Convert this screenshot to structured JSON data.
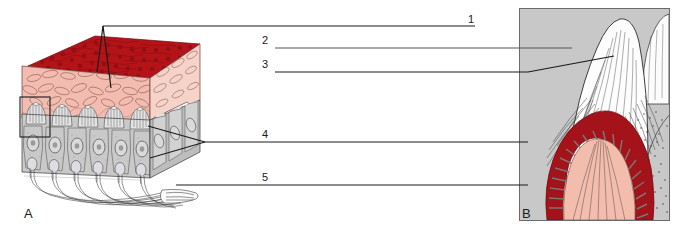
{
  "figure": {
    "panels": [
      {
        "id": "A",
        "letter": "A",
        "caption": "A",
        "description": "Three-dimensional block diagram of lingual epithelium with taste buds and nerve fibres"
      },
      {
        "id": "B",
        "letter": "B",
        "caption": "B",
        "description": "Sectional view of a filiform papilla on grey background"
      }
    ],
    "leader_labels": [
      {
        "number": "1",
        "text": "1",
        "line_color": "#1a1a1a",
        "line": {
          "x1": 103,
          "y1": 26,
          "x2": 475,
          "y2": 26
        },
        "label_pos": {
          "x": 468,
          "y": 16
        },
        "pointers": [
          {
            "x1": 103,
            "y1": 26,
            "x2": 97,
            "y2": 70
          },
          {
            "x1": 103,
            "y1": 26,
            "x2": 110,
            "y2": 86
          }
        ]
      },
      {
        "number": "2",
        "text": "2",
        "line_color": "#4a5a50",
        "line": {
          "x1": 275,
          "y1": 48,
          "x2": 570,
          "y2": 48
        },
        "label_pos": {
          "x": 262,
          "y": 36
        },
        "pointers": []
      },
      {
        "number": "3",
        "text": "3",
        "line_color": "#1a1a1a",
        "line": {
          "x1": 275,
          "y1": 72,
          "x2": 528,
          "y2": 72
        },
        "label_pos": {
          "x": 262,
          "y": 60
        },
        "pointers": [
          {
            "x1": 528,
            "y1": 72,
            "x2": 612,
            "y2": 56
          }
        ]
      },
      {
        "number": "4",
        "text": "4",
        "line_color": "#1a1a1a",
        "line": {
          "x1": 205,
          "y1": 142,
          "x2": 528,
          "y2": 142
        },
        "label_pos": {
          "x": 262,
          "y": 130
        },
        "pointers": [
          {
            "x1": 205,
            "y1": 142,
            "x2": 150,
            "y2": 126
          },
          {
            "x1": 205,
            "y1": 142,
            "x2": 152,
            "y2": 157
          }
        ]
      },
      {
        "number": "5",
        "text": "5",
        "line_color": "#1a1a1a",
        "line": {
          "x1": 176,
          "y1": 185,
          "x2": 528,
          "y2": 185
        },
        "label_pos": {
          "x": 262,
          "y": 173
        },
        "pointers": []
      }
    ],
    "detail_box": {
      "x": 20,
      "y": 97,
      "width": 30,
      "height": 40,
      "stroke": "#1a1a1a",
      "note": "inset highlight rectangle around one taste bud"
    },
    "colors": {
      "surface_red": "#B4151A",
      "deep_red": "#8E0F14",
      "pink_tissue": "#F2BDB0",
      "pale_pink": "#F6D3C8",
      "cell_grey": "#C9C9C9",
      "cell_grey_dark": "#9A9A9A",
      "panel_b_background": "#C8C8C8",
      "outline": "#1a1a1a",
      "green_leader": "#4a5a50",
      "white": "#FFFFFF"
    },
    "panel_b_frame": {
      "x": 519,
      "y": 8,
      "width": 150,
      "height": 212
    }
  }
}
